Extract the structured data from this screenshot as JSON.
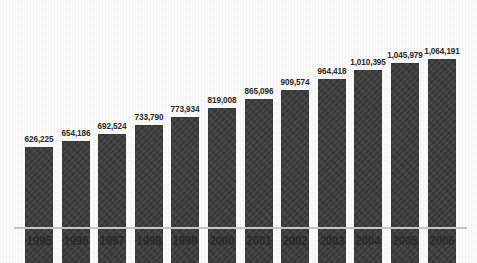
{
  "chart_data": {
    "type": "bar",
    "title": "",
    "subtitle": "",
    "xlabel": "",
    "ylabel": "",
    "grid": false,
    "legend": false,
    "axis_baseline_visible": true,
    "value_labels_shown": true,
    "ylim": [
      0,
      1064191
    ],
    "categories": [
      "1995",
      "1996",
      "1997",
      "1998",
      "1999",
      "2000",
      "2001",
      "2002",
      "2003",
      "2004",
      "2005",
      "2006"
    ],
    "values": [
      626225,
      654186,
      692524,
      733790,
      773934,
      819008,
      865096,
      909574,
      964418,
      1010395,
      1045979,
      1064191
    ],
    "value_labels": [
      "626,225",
      "654,186",
      "692,524",
      "733,790",
      "773,934",
      "819,008",
      "865,096",
      "909,574",
      "964,418",
      "1,010,395",
      "1,045,979",
      "1,064,191"
    ],
    "bar_color": "#3c3c3c",
    "axis_color": "#c9c9c6",
    "label_color": "#2b2b2b",
    "background_color": "#fdfdfc"
  }
}
